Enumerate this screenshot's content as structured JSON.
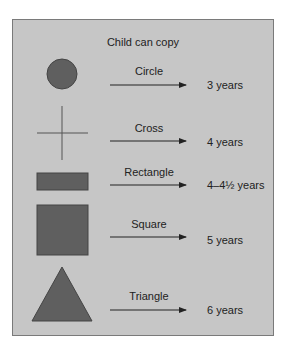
{
  "diagram": {
    "title": "Child can copy",
    "colors": {
      "panel_background": "#c6c6c6",
      "panel_border": "#7a7a7a",
      "shape_fill": "#5f5f5f",
      "line": "#333333"
    },
    "rows": [
      {
        "shape": "circle",
        "label": "Circle",
        "age": "3 years"
      },
      {
        "shape": "cross",
        "label": "Cross",
        "age": "4 years"
      },
      {
        "shape": "rectangle",
        "label": "Rectangle",
        "age": "4–4½ years"
      },
      {
        "shape": "square",
        "label": "Square",
        "age": "5 years"
      },
      {
        "shape": "triangle",
        "label": "Triangle",
        "age": "6 years"
      }
    ]
  }
}
